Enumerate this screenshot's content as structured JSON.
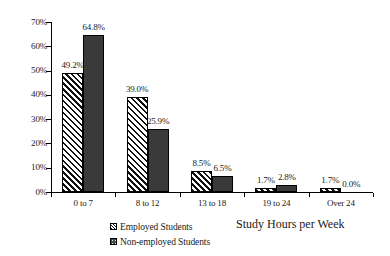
{
  "chart_data": {
    "type": "bar",
    "title": "",
    "subtitle": "",
    "xlabel": "Study Hours per Week",
    "ylabel": "",
    "categories": [
      "0 to 7",
      "8 to 12",
      "13 to 18",
      "19 to 24",
      "Over 24"
    ],
    "series": [
      {
        "name": "Employed Students",
        "values": [
          49.2,
          39.0,
          8.5,
          1.7,
          1.7
        ],
        "labels": [
          "49.2%",
          "39.0%",
          "8.5%",
          "1.7%",
          "1.7%"
        ],
        "pattern": "diagonal-hatch",
        "color": "#ffffff",
        "line_color": "#000000"
      },
      {
        "name": "Non-employed Students",
        "values": [
          64.8,
          25.9,
          6.5,
          2.8,
          0.0
        ],
        "labels": [
          "64.8%",
          "25.9%",
          "6.5%",
          "2.8%",
          "0.0%"
        ],
        "pattern": "dotted-fill",
        "color": "#3a3a3a",
        "line_color": "#000000"
      }
    ],
    "ylim": [
      0,
      70
    ],
    "ytick_values": [
      0,
      10,
      20,
      30,
      40,
      50,
      60,
      70
    ],
    "ytick_labels": [
      "0%",
      "10%",
      "20%",
      "30%",
      "40%",
      "50%",
      "60%",
      "70%"
    ],
    "grid": false,
    "legend_position": "bottom-center",
    "value_labels_shown": true,
    "axis_color": "#000000",
    "background": "#ffffff"
  },
  "legend": {
    "items": [
      {
        "label": "Employed Students",
        "swatch": "hatched-square-swatch"
      },
      {
        "label": "Non-employed Students",
        "swatch": "dotted-square-swatch"
      }
    ]
  }
}
